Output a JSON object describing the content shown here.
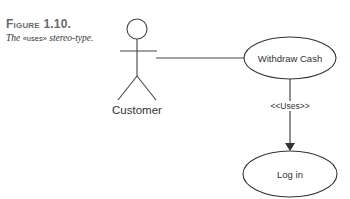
{
  "caption": {
    "figure_label": "Figure 1.10.",
    "text_before": "The ",
    "stereotype": "«uses»",
    "text_after": " stereo-type."
  },
  "diagram": {
    "actor": {
      "label": "Customer"
    },
    "use_cases": [
      {
        "label": "Withdraw Cash"
      },
      {
        "label": "Log in"
      }
    ],
    "relationship": {
      "label": "<<Uses>>"
    },
    "colors": {
      "stroke": "#333333",
      "text": "#333333",
      "caption_label": "#6a6a6a"
    }
  }
}
